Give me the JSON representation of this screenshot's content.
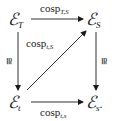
{
  "diagram": {
    "type": "commutative-square",
    "nodes": {
      "top_left": {
        "base": "ℰ",
        "sub": "T"
      },
      "top_right": {
        "base": "ℰ",
        "sub": "S"
      },
      "bottom_left": {
        "base": "ℰ",
        "sub": "t"
      },
      "bottom_right": {
        "base": "ℰ",
        "sub": "s",
        "suffix": "."
      }
    },
    "arrows": {
      "top": {
        "from": "top_left",
        "to": "top_right",
        "label_base": "cosp",
        "label_sub": "T,S"
      },
      "diagonal": {
        "from": "bottom_left",
        "to": "top_right",
        "label_base": "cosp",
        "label_sub": "t,S"
      },
      "bottom": {
        "from": "bottom_left",
        "to": "bottom_right",
        "label_base": "cosp",
        "label_sub": "t,s"
      },
      "left": {
        "from": "top_left",
        "to": "bottom_left",
        "label": "≅"
      },
      "right": {
        "from": "top_right",
        "to": "bottom_right",
        "label": "≅"
      }
    },
    "colors": {
      "ink": "#1a1a1a",
      "background": "#ffffff"
    }
  }
}
